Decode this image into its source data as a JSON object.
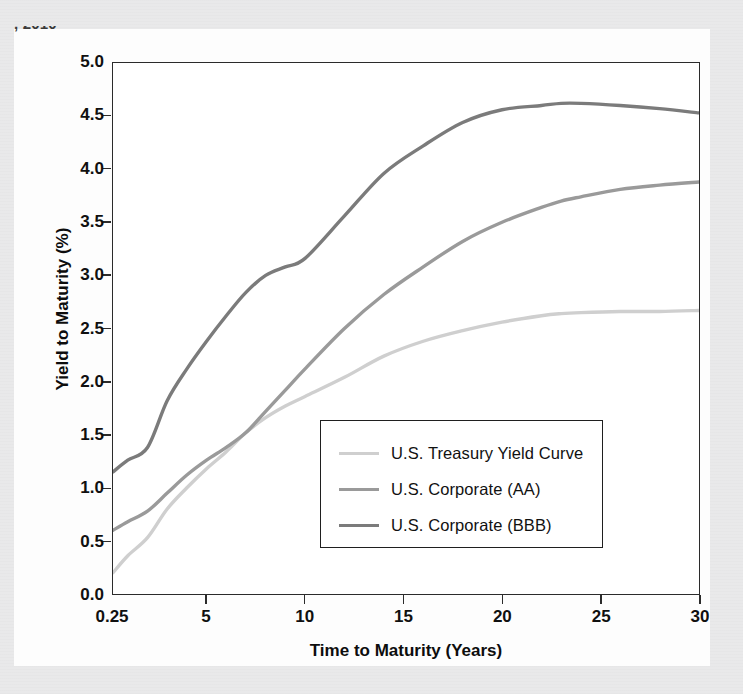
{
  "page": {
    "cropped_header_text": ", 2010",
    "background_color": "#e9e9ea",
    "paper_color": "#fdfdfd"
  },
  "chart_data": {
    "type": "line",
    "title": "",
    "xlabel": "Time to Maturity (Years)",
    "ylabel": "Yield to Maturity (%)",
    "xlim": [
      0.25,
      30
    ],
    "ylim": [
      0.0,
      5.0
    ],
    "grid": false,
    "legend_position": "center-right-inside",
    "xticks": [
      0.25,
      5,
      10,
      15,
      20,
      25,
      30
    ],
    "xtick_labels": [
      "0.25",
      "5",
      "10",
      "15",
      "20",
      "25",
      "30"
    ],
    "yticks": [
      0.0,
      0.5,
      1.0,
      1.5,
      2.0,
      2.5,
      3.0,
      3.5,
      4.0,
      4.5,
      5.0
    ],
    "ytick_labels": [
      "0.0",
      "0.5",
      "1.0",
      "1.5",
      "2.0",
      "2.5",
      "3.0",
      "3.5",
      "4.0",
      "4.5",
      "5.0"
    ],
    "x": [
      0.25,
      1,
      2,
      3,
      4,
      5,
      6,
      7,
      8,
      9,
      10,
      12,
      14,
      16,
      18,
      20,
      22,
      23,
      24,
      26,
      28,
      30
    ],
    "series": [
      {
        "name": "U.S. Treasury Yield Curve",
        "color": "#cfcfcf",
        "values": [
          0.2,
          0.36,
          0.53,
          0.8,
          1.0,
          1.18,
          1.34,
          1.52,
          1.66,
          1.77,
          1.86,
          2.04,
          2.24,
          2.38,
          2.48,
          2.56,
          2.62,
          2.64,
          2.65,
          2.66,
          2.66,
          2.67
        ]
      },
      {
        "name": "U.S. Corporate (AA)",
        "color": "#9a9a9a",
        "values": [
          0.6,
          0.68,
          0.78,
          0.95,
          1.12,
          1.26,
          1.38,
          1.52,
          1.72,
          1.92,
          2.12,
          2.5,
          2.82,
          3.08,
          3.32,
          3.5,
          3.64,
          3.7,
          3.74,
          3.81,
          3.85,
          3.88
        ]
      },
      {
        "name": "U.S. Corporate (BBB)",
        "color": "#7b7b7b",
        "values": [
          1.15,
          1.26,
          1.38,
          1.82,
          2.12,
          2.38,
          2.62,
          2.84,
          3.0,
          3.08,
          3.16,
          3.56,
          3.96,
          4.22,
          4.44,
          4.56,
          4.6,
          4.62,
          4.62,
          4.6,
          4.57,
          4.53
        ]
      }
    ],
    "legend_entries": [
      {
        "label": "U.S. Treasury Yield Curve",
        "color": "#cfcfcf"
      },
      {
        "label": "U.S. Corporate (AA)",
        "color": "#9a9a9a"
      },
      {
        "label": "U.S. Corporate (BBB)",
        "color": "#7b7b7b"
      }
    ]
  }
}
